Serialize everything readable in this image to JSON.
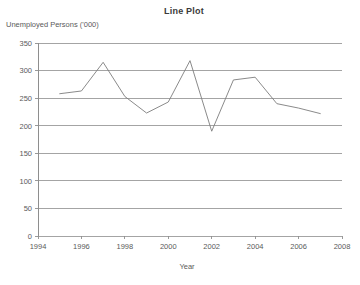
{
  "chart_data": {
    "type": "line",
    "title": "Line Plot",
    "xlabel": "Year",
    "ylabel": "Unemployed Persons ('000)",
    "ylabel_position": "top-left",
    "grid": true,
    "grid_orientation": "horizontal",
    "legend": "none",
    "xlim": [
      1994,
      2008
    ],
    "ylim": [
      0,
      350
    ],
    "yticks": [
      0,
      50,
      100,
      150,
      200,
      250,
      300,
      350
    ],
    "xticks": [
      1994,
      1996,
      1998,
      2000,
      2002,
      2004,
      2006,
      2008
    ],
    "series": [
      {
        "name": "Unemployed Persons",
        "color": "#7d7d7d",
        "x": [
          1995,
          1996,
          1997,
          1998,
          1999,
          2000,
          2001,
          2002,
          2003,
          2004,
          2005,
          2006,
          2007
        ],
        "values": [
          258,
          263,
          315,
          253,
          223,
          243,
          318,
          190,
          283,
          288,
          240,
          232,
          222
        ]
      }
    ]
  },
  "axis": {
    "y_tick_labels": [
      "350",
      "300",
      "250",
      "200",
      "150",
      "100",
      "50",
      "0"
    ],
    "x_tick_labels": [
      "1994",
      "1996",
      "1998",
      "2000",
      "2002",
      "2004",
      "2006",
      "2008"
    ]
  }
}
